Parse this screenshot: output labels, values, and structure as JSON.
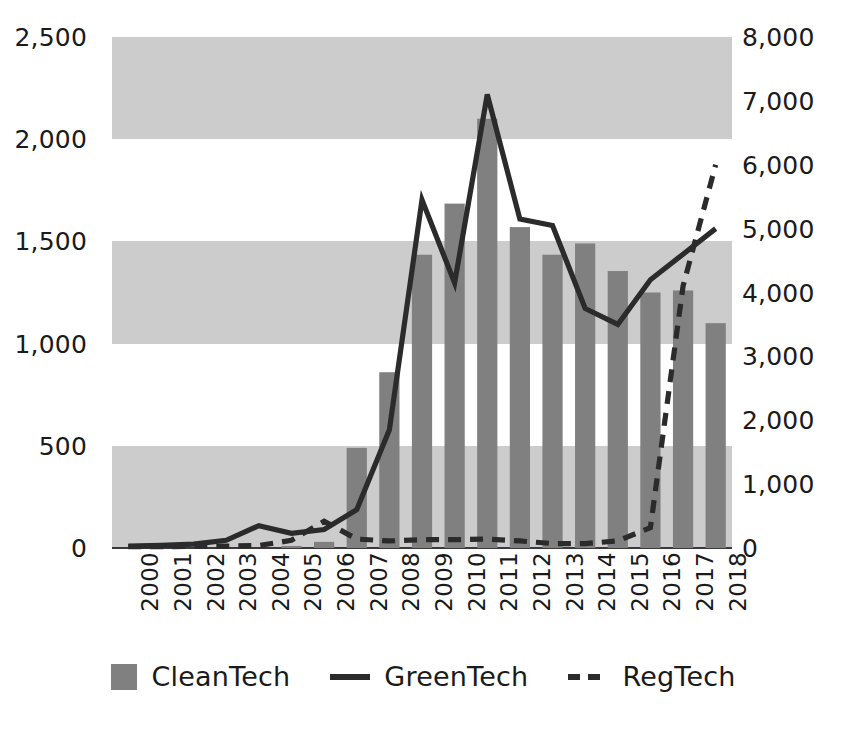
{
  "chart_data": {
    "type": "bar",
    "title": "",
    "xlabel": "",
    "ylabel": "",
    "grid": "horizontal-bands",
    "legend_position": "bottom-center",
    "categories": [
      "2000",
      "2001",
      "2002",
      "2003",
      "2004",
      "2005",
      "2006",
      "2007",
      "2008",
      "2009",
      "2010",
      "2011",
      "2012",
      "2013",
      "2014",
      "2015",
      "2016",
      "2017",
      "2018"
    ],
    "axes": {
      "left": {
        "ylim": [
          0,
          2500
        ],
        "ticks": [
          0,
          500,
          1000,
          1500,
          2000,
          2500
        ],
        "tick_labels": [
          "0",
          "500",
          "1,000",
          "1,500",
          "2,000",
          "2,500"
        ],
        "series": [
          "CleanTech"
        ]
      },
      "right": {
        "ylim": [
          0,
          8000
        ],
        "ticks": [
          0,
          1000,
          2000,
          3000,
          4000,
          5000,
          6000,
          7000,
          8000
        ],
        "tick_labels": [
          "0",
          "1,000",
          "2,000",
          "3,000",
          "4,000",
          "5,000",
          "6,000",
          "7,000",
          "8,000"
        ],
        "series": [
          "GreenTech",
          "RegTech"
        ]
      }
    },
    "series": [
      {
        "name": "CleanTech",
        "type": "bar",
        "axis": "left",
        "color": "#808080",
        "values": [
          0,
          0,
          0,
          0,
          0,
          10,
          30,
          490,
          860,
          1435,
          1685,
          2100,
          1570,
          1435,
          1490,
          1355,
          1250,
          1260,
          1100
        ]
      },
      {
        "name": "GreenTech",
        "type": "line",
        "style": "solid",
        "axis": "right",
        "color": "#2b2b2b",
        "values": [
          30,
          40,
          60,
          120,
          350,
          230,
          290,
          600,
          1850,
          5450,
          4150,
          7100,
          5150,
          5050,
          3750,
          3500,
          4200,
          4600,
          5000
        ]
      },
      {
        "name": "RegTech",
        "type": "line",
        "style": "dashed",
        "axis": "right",
        "color": "#2b2b2b",
        "values": [
          20,
          20,
          25,
          30,
          40,
          120,
          420,
          140,
          110,
          130,
          130,
          140,
          110,
          70,
          70,
          110,
          320,
          4100,
          6000
        ]
      }
    ]
  },
  "legend": {
    "items": [
      {
        "label": "CleanTech",
        "marker": "bar-swatch"
      },
      {
        "label": "GreenTech",
        "marker": "solid-line-swatch"
      },
      {
        "label": "RegTech",
        "marker": "dashed-line-swatch"
      }
    ]
  }
}
